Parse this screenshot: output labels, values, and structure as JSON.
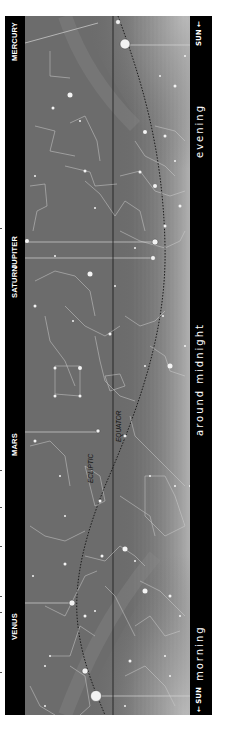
{
  "chart": {
    "orientation": "rotated-90",
    "planets": [
      {
        "name": "MERCURY",
        "label_y": 45,
        "line_y": 42
      },
      {
        "name": "SATURN",
        "label_y": 282,
        "line_y": 274
      },
      {
        "name": "JUPITER",
        "label_y": 253,
        "line_y": 242
      },
      {
        "name": "MARS",
        "label_y": 440,
        "line_y": 432
      },
      {
        "name": "VENUS",
        "label_y": 625,
        "line_y": 618
      }
    ],
    "time_zones": [
      {
        "label": "evening",
        "center_y": 110
      },
      {
        "label": "around midnight",
        "center_y": 340
      },
      {
        "label": "morning",
        "center_y": 630
      }
    ],
    "sun_labels": [
      {
        "label": "SUN",
        "arrow": "←",
        "position": "top"
      },
      {
        "label": "SUN",
        "arrow": "←",
        "position": "bottom"
      }
    ],
    "lines": {
      "ecliptic_label": "ECLIPTIC",
      "equator_label": "EQUATOR"
    },
    "colors": {
      "band": "#000000",
      "sky_dark": "#6a6a6a",
      "sky_light": "#a8a8a8",
      "stars": "#f2f2f2",
      "constellation_lines": "#d0d0d0",
      "text": "#ffffff"
    }
  }
}
